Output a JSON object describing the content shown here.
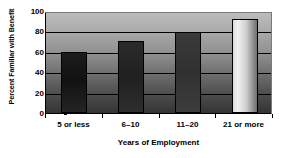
{
  "chart_data": {
    "type": "bar",
    "title": "",
    "xlabel": "Years of Employment",
    "ylabel": "Percent Familiar with Benefit",
    "categories": [
      "5 or less",
      "6–10",
      "11–20",
      "21 or more"
    ],
    "values": [
      60,
      71,
      79,
      92
    ],
    "ylim": [
      0,
      100
    ],
    "yticks": [
      0,
      20,
      40,
      60,
      80,
      100
    ],
    "ytick_labels": [
      "0",
      "20",
      "40",
      "60",
      "80",
      "100"
    ],
    "grid": true,
    "grid_axis": "y",
    "legend": false,
    "bar_styles": [
      "dark",
      "dark2",
      "dark3",
      "light"
    ],
    "plot_background": "vertical gray gradient light-to-dark",
    "colors": {
      "axis": "#000000",
      "gridline": "#000000",
      "plot_bg_top": "#bdbdbd",
      "plot_bg_bottom": "#343434",
      "bar_1": "#111111",
      "bar_2": "#202020",
      "bar_3": "#303030",
      "bar_4": "#e8e8e8",
      "page_bg": "#ffffff"
    }
  }
}
